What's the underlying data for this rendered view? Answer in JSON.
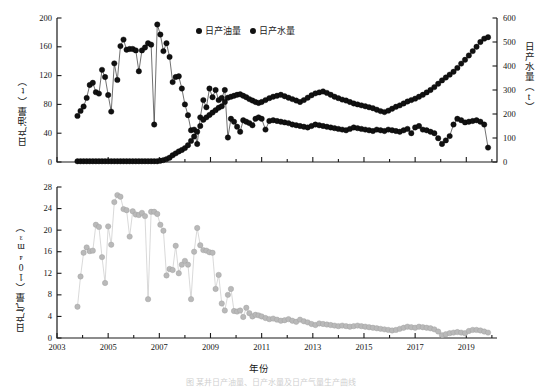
{
  "figure": {
    "caption": "图 某井日产油量、日产水量及日产气量生产曲线"
  },
  "legend": {
    "position": "top-center",
    "entries": [
      {
        "label": "日产油量",
        "color": "#111111",
        "marker": "filled-circle"
      },
      {
        "label": "日产水量",
        "color": "#111111",
        "marker": "filled-circle"
      }
    ]
  },
  "axes": {
    "x_label": "年份",
    "x_ticks": [
      2003,
      2005,
      2007,
      2009,
      2011,
      2013,
      2015,
      2017,
      2019
    ],
    "x_minor_step": 1,
    "x_range": [
      2003,
      2020.2
    ],
    "top_left_label": "日产油量（t）",
    "top_left_ticks": [
      0,
      40,
      80,
      120,
      160,
      200
    ],
    "top_left_range": [
      0,
      200
    ],
    "top_right_label": "日产水量（t）",
    "top_right_ticks": [
      0,
      100,
      200,
      300,
      400,
      500,
      600
    ],
    "top_right_range": [
      0,
      600
    ],
    "bottom_left_label": "日产气量（10⁴m³）",
    "bottom_left_ticks": [
      0,
      4,
      8,
      12,
      16,
      20,
      24,
      28
    ],
    "bottom_left_range": [
      0,
      28
    ]
  },
  "colors": {
    "oil": "#111111",
    "water": "#111111",
    "gas": "#b9b9b9",
    "gas_line": "#c9c9c9",
    "axis": "#1a1a1a"
  },
  "chart_data": [
    {
      "type": "line",
      "id": "upper-panel",
      "title": "",
      "xlabel": "",
      "ylabel": "日产油量（t）",
      "y2label": "日产水量（t）",
      "xlim": [
        2003,
        2020.2
      ],
      "ylim": [
        0,
        200
      ],
      "y2lim": [
        0,
        600
      ],
      "grid": false,
      "legend_position": "top-center",
      "series": [
        {
          "name": "日产油量",
          "axis": "left",
          "unit": "t",
          "color": "#111111",
          "x": [
            2003.8,
            2003.92,
            2004.04,
            2004.16,
            2004.28,
            2004.4,
            2004.52,
            2004.64,
            2004.76,
            2004.88,
            2005.0,
            2005.12,
            2005.24,
            2005.36,
            2005.48,
            2005.6,
            2005.72,
            2005.84,
            2005.96,
            2006.08,
            2006.2,
            2006.32,
            2006.44,
            2006.56,
            2006.68,
            2006.8,
            2006.92,
            2007.04,
            2007.16,
            2007.28,
            2007.4,
            2007.52,
            2007.64,
            2007.76,
            2007.88,
            2008.0,
            2008.12,
            2008.24,
            2008.36,
            2008.48,
            2008.6,
            2008.72,
            2008.84,
            2008.96,
            2009.08,
            2009.2,
            2009.32,
            2009.44,
            2009.56,
            2009.68,
            2009.8,
            2009.92,
            2010.04,
            2010.16,
            2010.28,
            2010.4,
            2010.52,
            2010.64,
            2010.76,
            2010.88,
            2011.0,
            2011.15,
            2011.3,
            2011.45,
            2011.6,
            2011.75,
            2011.9,
            2012.05,
            2012.2,
            2012.35,
            2012.5,
            2012.65,
            2012.8,
            2012.95,
            2013.1,
            2013.25,
            2013.4,
            2013.55,
            2013.7,
            2013.85,
            2014.0,
            2014.15,
            2014.3,
            2014.45,
            2014.6,
            2014.75,
            2014.9,
            2015.05,
            2015.2,
            2015.35,
            2015.5,
            2015.65,
            2015.8,
            2015.95,
            2016.1,
            2016.25,
            2016.4,
            2016.55,
            2016.7,
            2016.85,
            2017.0,
            2017.15,
            2017.3,
            2017.45,
            2017.6,
            2017.75,
            2017.9,
            2018.05,
            2018.2,
            2018.35,
            2018.5,
            2018.65,
            2018.8,
            2018.95,
            2019.1,
            2019.25,
            2019.4,
            2019.55,
            2019.7,
            2019.85
          ],
          "y": [
            64,
            71,
            77,
            89,
            107,
            110,
            97,
            95,
            128,
            118,
            93,
            70,
            137,
            114,
            161,
            170,
            156,
            157,
            157,
            155,
            126,
            155,
            159,
            165,
            163,
            52,
            191,
            177,
            154,
            165,
            146,
            111,
            118,
            119,
            102,
            80,
            65,
            44,
            45,
            25,
            62,
            86,
            76,
            102,
            90,
            100,
            86,
            89,
            100,
            34,
            60,
            56,
            49,
            42,
            58,
            56,
            54,
            51,
            60,
            62,
            60,
            45,
            57,
            58,
            57,
            56,
            55,
            54,
            52,
            51,
            50,
            49,
            48,
            50,
            52,
            51,
            50,
            49,
            48,
            47,
            46,
            45,
            44,
            46,
            48,
            47,
            46,
            45,
            44,
            43,
            45,
            44,
            43,
            45,
            44,
            43,
            42,
            44,
            46,
            40,
            48,
            50,
            45,
            44,
            42,
            40,
            33,
            25,
            30,
            36,
            52,
            60,
            58,
            55,
            56,
            57,
            58,
            56,
            52,
            20
          ]
        },
        {
          "name": "日产水量",
          "axis": "right",
          "unit": "t",
          "color": "#111111",
          "x": [
            2003.8,
            2003.92,
            2004.04,
            2004.16,
            2004.28,
            2004.4,
            2004.52,
            2004.64,
            2004.76,
            2004.88,
            2005.0,
            2005.12,
            2005.24,
            2005.36,
            2005.48,
            2005.6,
            2005.72,
            2005.84,
            2005.96,
            2006.08,
            2006.2,
            2006.32,
            2006.44,
            2006.56,
            2006.68,
            2006.8,
            2006.92,
            2007.04,
            2007.16,
            2007.28,
            2007.4,
            2007.52,
            2007.64,
            2007.76,
            2007.88,
            2008.0,
            2008.12,
            2008.24,
            2008.36,
            2008.48,
            2008.6,
            2008.72,
            2008.84,
            2008.96,
            2009.08,
            2009.2,
            2009.32,
            2009.44,
            2009.56,
            2009.68,
            2009.8,
            2009.92,
            2010.04,
            2010.16,
            2010.28,
            2010.4,
            2010.52,
            2010.64,
            2010.76,
            2010.88,
            2011.0,
            2011.15,
            2011.3,
            2011.45,
            2011.6,
            2011.75,
            2011.9,
            2012.05,
            2012.2,
            2012.35,
            2012.5,
            2012.65,
            2012.8,
            2012.95,
            2013.1,
            2013.25,
            2013.4,
            2013.55,
            2013.7,
            2013.85,
            2014.0,
            2014.15,
            2014.3,
            2014.45,
            2014.6,
            2014.75,
            2014.9,
            2015.05,
            2015.2,
            2015.35,
            2015.5,
            2015.65,
            2015.8,
            2015.95,
            2016.1,
            2016.25,
            2016.4,
            2016.55,
            2016.7,
            2016.85,
            2017.0,
            2017.15,
            2017.3,
            2017.45,
            2017.6,
            2017.75,
            2017.9,
            2018.05,
            2018.2,
            2018.35,
            2018.5,
            2018.65,
            2018.8,
            2018.95,
            2019.1,
            2019.25,
            2019.4,
            2019.55,
            2019.7,
            2019.85
          ],
          "y": [
            3,
            3,
            3,
            3,
            3,
            3,
            3,
            3,
            3,
            3,
            3,
            3,
            3,
            3,
            3,
            3,
            3,
            3,
            3,
            3,
            3,
            3,
            3,
            3,
            3,
            3,
            3,
            5,
            8,
            12,
            18,
            28,
            36,
            44,
            50,
            58,
            70,
            88,
            106,
            126,
            150,
            176,
            186,
            196,
            206,
            216,
            226,
            232,
            250,
            268,
            272,
            276,
            280,
            282,
            276,
            270,
            262,
            256,
            250,
            246,
            250,
            258,
            266,
            272,
            276,
            280,
            274,
            268,
            262,
            256,
            250,
            258,
            268,
            278,
            286,
            290,
            294,
            288,
            280,
            272,
            266,
            260,
            256,
            250,
            244,
            240,
            236,
            232,
            228,
            224,
            218,
            212,
            208,
            214,
            222,
            230,
            236,
            244,
            252,
            258,
            264,
            272,
            280,
            290,
            300,
            312,
            326,
            340,
            352,
            364,
            376,
            392,
            410,
            426,
            444,
            462,
            480,
            500,
            514,
            520
          ]
        }
      ]
    },
    {
      "type": "line",
      "id": "lower-panel",
      "title": "",
      "xlabel": "年份",
      "ylabel": "日产气量（10⁴m³）",
      "xlim": [
        2003,
        2020.2
      ],
      "ylim": [
        0,
        28
      ],
      "grid": false,
      "series": [
        {
          "name": "日产气量",
          "axis": "left",
          "unit": "10⁴m³",
          "color": "#b9b9b9",
          "x": [
            2003.8,
            2003.92,
            2004.04,
            2004.16,
            2004.28,
            2004.4,
            2004.52,
            2004.64,
            2004.76,
            2004.88,
            2005.0,
            2005.12,
            2005.24,
            2005.36,
            2005.48,
            2005.6,
            2005.72,
            2005.84,
            2005.96,
            2006.08,
            2006.2,
            2006.32,
            2006.44,
            2006.56,
            2006.68,
            2006.8,
            2006.92,
            2007.04,
            2007.16,
            2007.28,
            2007.4,
            2007.52,
            2007.64,
            2007.76,
            2007.88,
            2008.0,
            2008.12,
            2008.24,
            2008.36,
            2008.48,
            2008.6,
            2008.72,
            2008.84,
            2008.96,
            2009.08,
            2009.2,
            2009.32,
            2009.44,
            2009.56,
            2009.68,
            2009.8,
            2009.92,
            2010.04,
            2010.16,
            2010.28,
            2010.4,
            2010.52,
            2010.64,
            2010.76,
            2010.88,
            2011.0,
            2011.15,
            2011.3,
            2011.45,
            2011.6,
            2011.75,
            2011.9,
            2012.05,
            2012.2,
            2012.35,
            2012.5,
            2012.65,
            2012.8,
            2012.95,
            2013.1,
            2013.25,
            2013.4,
            2013.55,
            2013.7,
            2013.85,
            2014.0,
            2014.15,
            2014.3,
            2014.45,
            2014.6,
            2014.75,
            2014.9,
            2015.05,
            2015.2,
            2015.35,
            2015.5,
            2015.65,
            2015.8,
            2015.95,
            2016.1,
            2016.25,
            2016.4,
            2016.55,
            2016.7,
            2016.85,
            2017.0,
            2017.15,
            2017.3,
            2017.45,
            2017.6,
            2017.75,
            2017.9,
            2018.05,
            2018.2,
            2018.35,
            2018.5,
            2018.65,
            2018.8,
            2018.95,
            2019.1,
            2019.25,
            2019.4,
            2019.55,
            2019.7,
            2019.85
          ],
          "y": [
            5.8,
            11.4,
            15.8,
            16.8,
            16.1,
            16.2,
            21.0,
            20.6,
            15.0,
            10.2,
            20.7,
            17.3,
            25.2,
            26.5,
            26.2,
            23.9,
            23.7,
            18.8,
            23.5,
            22.9,
            22.8,
            23.2,
            22.6,
            7.2,
            23.4,
            23.4,
            23.0,
            21.0,
            19.9,
            11.6,
            12.8,
            12.6,
            17.1,
            12.0,
            13.6,
            14.3,
            13.6,
            7.2,
            16.0,
            20.4,
            17.2,
            16.3,
            16.2,
            15.9,
            15.8,
            9.1,
            11.7,
            6.4,
            5.1,
            8.0,
            9.1,
            5.0,
            4.9,
            5.1,
            3.9,
            5.6,
            4.6,
            4.0,
            4.3,
            4.2,
            4.0,
            3.7,
            3.5,
            3.6,
            3.4,
            3.2,
            3.3,
            3.5,
            3.2,
            3.0,
            3.4,
            3.1,
            2.9,
            2.6,
            2.4,
            2.7,
            2.6,
            2.5,
            2.4,
            2.3,
            2.2,
            2.3,
            2.2,
            2.1,
            2.2,
            2.3,
            2.2,
            2.1,
            2.0,
            1.9,
            1.8,
            1.7,
            1.6,
            1.5,
            1.4,
            1.5,
            1.7,
            1.9,
            2.1,
            2.0,
            1.9,
            2.1,
            2.0,
            1.9,
            1.8,
            1.6,
            1.2,
            0.5,
            0.7,
            0.9,
            1.0,
            1.1,
            1.0,
            0.9,
            1.3,
            1.5,
            1.5,
            1.4,
            1.2,
            1.0
          ]
        }
      ]
    }
  ]
}
